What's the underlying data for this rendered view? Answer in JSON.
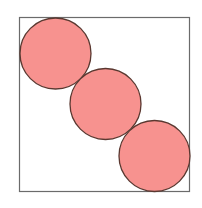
{
  "diagram": {
    "square": {
      "x": 19.5,
      "y": 17.5,
      "width": 170,
      "height": 174,
      "stroke": "#6b6b6b",
      "fill": "#ffffff"
    },
    "circle_style": {
      "fill": "#F7928F",
      "stroke": "#5a3830"
    },
    "circles": [
      {
        "cx": 55.5,
        "cy": 53.5,
        "r": 35.5
      },
      {
        "cx": 105.5,
        "cy": 104,
        "r": 35.5
      },
      {
        "cx": 154.5,
        "cy": 156,
        "r": 35.5
      }
    ]
  }
}
